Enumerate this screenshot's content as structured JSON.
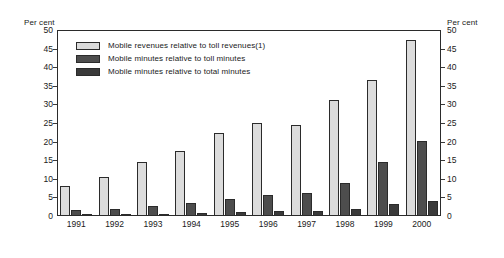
{
  "chart_data": {
    "type": "bar",
    "title": "",
    "subtitle": "",
    "xlabel": "",
    "ylabel": "Per cent",
    "ylabel_right": "Per cent",
    "categories": [
      "1991",
      "1992",
      "1993",
      "1994",
      "1995",
      "1996",
      "1997",
      "1998",
      "1999",
      "2000"
    ],
    "ylim": [
      0,
      50
    ],
    "ytick_step": 5,
    "yticks": [
      "0",
      "5",
      "10",
      "15",
      "20",
      "25",
      "30",
      "35",
      "40",
      "45",
      "50"
    ],
    "yticks_right": [
      "0",
      "5",
      "10",
      "15",
      "20",
      "25",
      "30",
      "35",
      "40",
      "45",
      "50"
    ],
    "grid": false,
    "legend_position": "top-left inside plot",
    "series": [
      {
        "name": "Mobile revenues relative to toll revenues(1)",
        "color": "#dcdcdc",
        "values": [
          8.2,
          10.6,
          14.4,
          17.5,
          22.2,
          25.1,
          24.6,
          31.2,
          36.6,
          47.2
        ]
      },
      {
        "name": "Mobile minutes relative to toll minutes",
        "color": "#4d4d4d",
        "values": [
          1.5,
          1.9,
          2.6,
          3.4,
          4.5,
          5.7,
          6.3,
          8.8,
          14.4,
          20.2
        ]
      },
      {
        "name": "Mobile minutes relative to total minutes",
        "color": "#3a3a3a",
        "values": [
          0.3,
          0.4,
          0.5,
          0.8,
          1.1,
          1.3,
          1.4,
          1.8,
          3.1,
          4.1
        ]
      }
    ]
  }
}
